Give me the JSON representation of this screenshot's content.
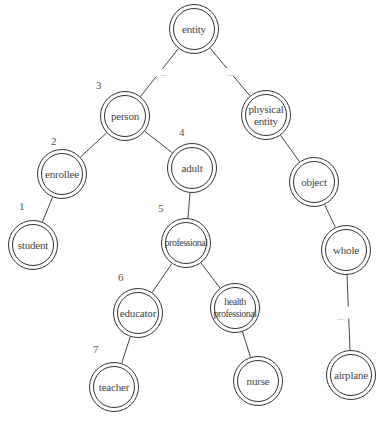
{
  "diagram": {
    "type": "tree",
    "nodes": [
      {
        "id": "entity",
        "label": "entity",
        "x": 194,
        "y": 29
      },
      {
        "id": "person",
        "label": "person",
        "x": 125,
        "y": 116
      },
      {
        "id": "physical_entity",
        "label": "physical\nentity",
        "x": 266,
        "y": 115
      },
      {
        "id": "enrollee",
        "label": "enrollee",
        "x": 62,
        "y": 174
      },
      {
        "id": "adult",
        "label": "adult",
        "x": 192,
        "y": 168
      },
      {
        "id": "object",
        "label": "object",
        "x": 314,
        "y": 182
      },
      {
        "id": "student",
        "label": "student",
        "x": 33,
        "y": 245
      },
      {
        "id": "professional",
        "label": "professional",
        "x": 186,
        "y": 243
      },
      {
        "id": "whole",
        "label": "whole",
        "x": 346,
        "y": 250
      },
      {
        "id": "educator",
        "label": "educator",
        "x": 138,
        "y": 313
      },
      {
        "id": "health_professional",
        "label": "health\nprofessional",
        "x": 235,
        "y": 308
      },
      {
        "id": "teacher",
        "label": "teacher",
        "x": 114,
        "y": 387
      },
      {
        "id": "nurse",
        "label": "nurse",
        "x": 258,
        "y": 381
      },
      {
        "id": "airplane",
        "label": "airplane",
        "x": 351,
        "y": 375
      }
    ],
    "edges": [
      {
        "from": "entity",
        "to": "person",
        "elided": true
      },
      {
        "from": "entity",
        "to": "physical_entity",
        "elided": true
      },
      {
        "from": "person",
        "to": "enrollee"
      },
      {
        "from": "person",
        "to": "adult"
      },
      {
        "from": "enrollee",
        "to": "student"
      },
      {
        "from": "adult",
        "to": "professional"
      },
      {
        "from": "professional",
        "to": "educator"
      },
      {
        "from": "professional",
        "to": "health_professional"
      },
      {
        "from": "educator",
        "to": "teacher"
      },
      {
        "from": "health_professional",
        "to": "nurse"
      },
      {
        "from": "physical_entity",
        "to": "object"
      },
      {
        "from": "object",
        "to": "whole"
      },
      {
        "from": "whole",
        "to": "airplane",
        "elided": true
      }
    ],
    "ellipses": [
      {
        "text": "...",
        "x": 160,
        "y": 68
      },
      {
        "text": "...",
        "x": 226,
        "y": 68
      },
      {
        "text": "...",
        "x": 337,
        "y": 312
      }
    ],
    "path_numbers": [
      {
        "text": "1",
        "x": 19,
        "y": 200
      },
      {
        "text": "2",
        "x": 51,
        "y": 135
      },
      {
        "text": "3",
        "x": 96,
        "y": 79
      },
      {
        "text": "4",
        "x": 179,
        "y": 126
      },
      {
        "text": "5",
        "x": 158,
        "y": 202
      },
      {
        "text": "6",
        "x": 118,
        "y": 271
      },
      {
        "text": "7",
        "x": 93,
        "y": 343
      }
    ]
  }
}
